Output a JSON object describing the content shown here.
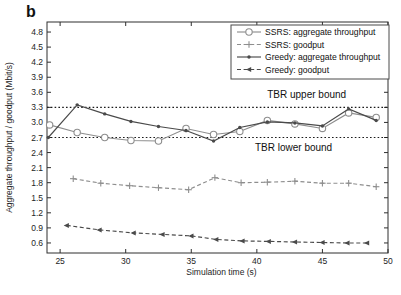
{
  "figure_label": "b",
  "chart_data": {
    "type": "line",
    "title": "",
    "xlabel": "Simulation time (s)",
    "ylabel": "Aggregate throughput / goodput (Mbit/s)",
    "xlim": [
      24,
      50
    ],
    "ylim": [
      0.4,
      5.0
    ],
    "xticks": [
      25,
      30,
      35,
      40,
      45,
      50
    ],
    "yticks": [
      0.6,
      0.9,
      1.2,
      1.5,
      1.8,
      2.1,
      2.4,
      2.7,
      3.0,
      3.3,
      3.6,
      3.9,
      4.2,
      4.5,
      4.8
    ],
    "grid": false,
    "legend_position": "upper right",
    "colors": {
      "ssrs": "#8e8e8e",
      "greedy": "#4a4a4a",
      "bounds": "#1a1a1a",
      "axis": "#2f2f2f",
      "background": "#ffffff"
    },
    "reference_lines": [
      {
        "label": "TBR upper bound",
        "y": 3.3,
        "label_x": 43.8,
        "label_y": 3.55
      },
      {
        "label": "TBR lower bound",
        "y": 2.7,
        "label_x": 42.8,
        "label_y": 2.5
      }
    ],
    "series": [
      {
        "name": "SSRS: aggregate throughput",
        "color": "#8e8e8e",
        "line": "solid",
        "marker": "circle-open",
        "x": [
          24.2,
          26.3,
          28.4,
          30.4,
          32.5,
          34.6,
          36.7,
          38.7,
          40.8,
          42.9,
          45.0,
          47.0,
          49.1
        ],
        "y": [
          2.95,
          2.8,
          2.7,
          2.64,
          2.63,
          2.88,
          2.76,
          2.82,
          3.04,
          2.97,
          2.88,
          3.19,
          3.1
        ]
      },
      {
        "name": "SSRS: goodput",
        "color": "#8e8e8e",
        "line": "dashed",
        "marker": "plus",
        "x": [
          26.0,
          28.1,
          30.3,
          32.5,
          34.8,
          36.8,
          38.8,
          40.8,
          42.9,
          45.0,
          47.0,
          49.1
        ],
        "y": [
          1.88,
          1.79,
          1.74,
          1.7,
          1.66,
          1.9,
          1.8,
          1.81,
          1.83,
          1.79,
          1.79,
          1.72
        ]
      },
      {
        "name": "Greedy: aggregate throughput",
        "color": "#4a4a4a",
        "line": "solid",
        "marker": "dot",
        "x": [
          24.1,
          26.3,
          28.4,
          30.4,
          32.5,
          34.6,
          36.7,
          38.7,
          40.8,
          42.9,
          45.0,
          47.0,
          49.1
        ],
        "y": [
          2.7,
          3.35,
          3.17,
          3.02,
          2.92,
          2.84,
          2.63,
          2.9,
          3.01,
          2.99,
          2.93,
          3.27,
          3.04
        ]
      },
      {
        "name": "Greedy: goodput",
        "color": "#4a4a4a",
        "line": "dashed",
        "marker": "triangle-left",
        "x": [
          25.5,
          28.0,
          30.6,
          32.8,
          35.0,
          36.9,
          38.9,
          40.9,
          42.9,
          45.0,
          46.9,
          48.4
        ],
        "y": [
          0.95,
          0.86,
          0.8,
          0.77,
          0.74,
          0.67,
          0.64,
          0.63,
          0.62,
          0.61,
          0.6,
          0.6
        ]
      }
    ]
  }
}
